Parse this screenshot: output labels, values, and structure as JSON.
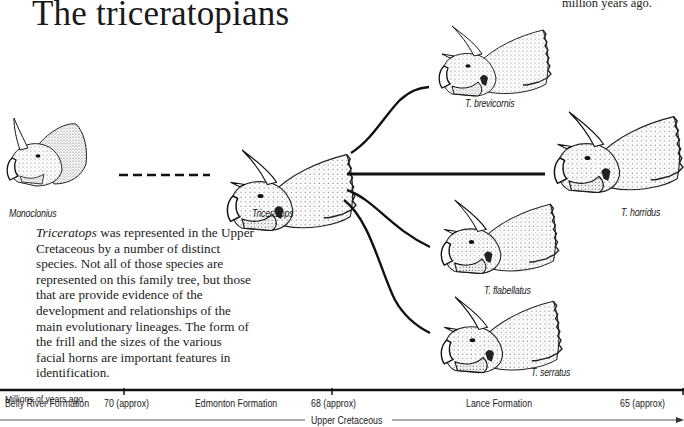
{
  "title": "The triceratopians",
  "top_note": "million years ago.",
  "paragraph": {
    "italic_lead": "Triceratops",
    "text": " was represented in the Upper Cretaceous by a number of distinct species. Not all of those species are represented on this family tree, but those that are provide evidence of the development and relationships of the main evolutionary lineages. The form of the frill and the sizes of the various facial horns are important features in identification."
  },
  "species": [
    {
      "id": "monoclonius",
      "label": "Monoclonius"
    },
    {
      "id": "triceratops",
      "label": "Triceratops"
    },
    {
      "id": "brevicornis",
      "label": "T. brevicornis"
    },
    {
      "id": "horridus",
      "label": "T. horridus"
    },
    {
      "id": "flabellatus",
      "label": "T. flabellatus"
    },
    {
      "id": "serratus",
      "label": "T. serratus"
    }
  ],
  "timeline": {
    "caption": "Millions of years ago",
    "labels": [
      {
        "text": "Belly River Formation"
      },
      {
        "text": "70 (approx)"
      },
      {
        "text": "Edmonton Formation"
      },
      {
        "text": "68 (approx)"
      },
      {
        "text": "Lance Formation"
      },
      {
        "text": "65 (approx)"
      }
    ],
    "period": "Upper Cretaceous"
  },
  "colors": {
    "ink": "#1a1a1a",
    "shade": "#8a8a8a",
    "paper": "#ffffff"
  }
}
